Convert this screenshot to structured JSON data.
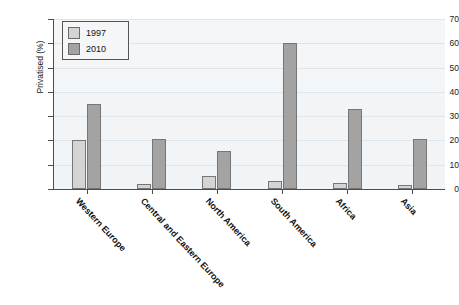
{
  "chart_data": {
    "type": "bar",
    "title": "",
    "xlabel": "",
    "ylabel": "Privatised (%)",
    "ylim": [
      0,
      70
    ],
    "ytick_step": 10,
    "yticks": [
      "0",
      "10",
      "20",
      "30",
      "40",
      "50",
      "60",
      "70"
    ],
    "grid": true,
    "legend_position": "top-left",
    "categories": [
      "Western Europe",
      "Central and Eastern Europe",
      "North America",
      "South America",
      "Africa",
      "Asia"
    ],
    "series": [
      {
        "name": "1997",
        "color": "#d4d4d4",
        "values": [
          20,
          2,
          5.5,
          3.5,
          2.5,
          1.5
        ]
      },
      {
        "name": "2010",
        "color": "#a3a3a3",
        "values": [
          35,
          20.5,
          15.5,
          60,
          33,
          20.5
        ]
      }
    ]
  },
  "legend": {
    "entries": [
      {
        "label": "1997"
      },
      {
        "label": "2010"
      }
    ]
  },
  "colors": {
    "series_1997": "#d4d4d4",
    "series_2010": "#a3a3a3",
    "axis": "#4d4d4d",
    "grid": "#dde6ec",
    "plot_background": "#f2f5f7"
  }
}
